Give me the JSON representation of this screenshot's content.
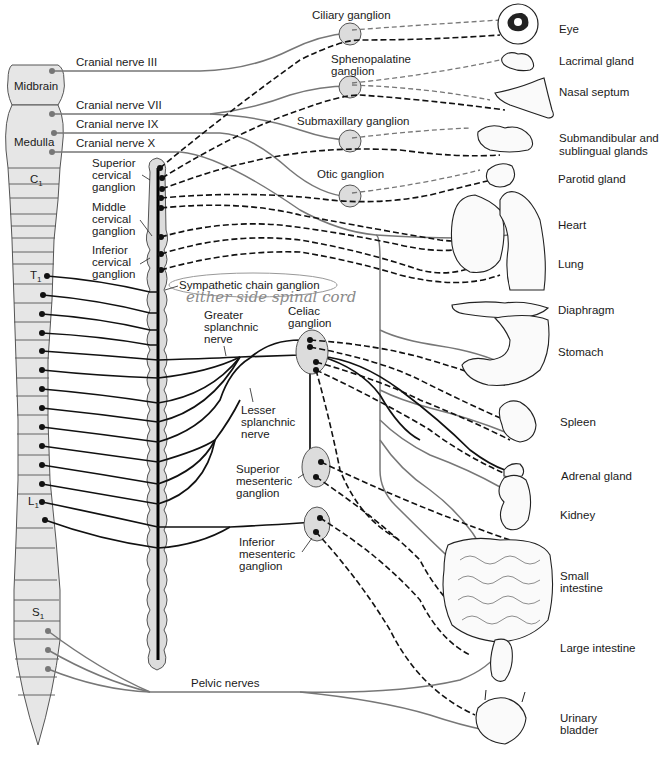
{
  "diagram": {
    "cns": {
      "regions": [
        {
          "id": "midbrain",
          "label": "Midbrain"
        },
        {
          "id": "medulla",
          "label": "Medulla"
        }
      ],
      "segment_labels": {
        "c1": "C",
        "c1_sub": "1",
        "t1": "T",
        "t1_sub": "1",
        "l1": "L",
        "l1_sub": "1",
        "s1": "S",
        "s1_sub": "1"
      }
    },
    "cranial_nerves": [
      {
        "label": "Cranial nerve III"
      },
      {
        "label": "Cranial nerve VII"
      },
      {
        "label": "Cranial nerve IX"
      },
      {
        "label": "Cranial nerve X"
      }
    ],
    "parasympathetic_ganglia": [
      {
        "label": "Ciliary ganglion"
      },
      {
        "label_line1": "Sphenopalatine",
        "label_line2": "ganglion"
      },
      {
        "label": "Submaxillary ganglion"
      },
      {
        "label": "Otic ganglion"
      }
    ],
    "cervical_ganglia": [
      {
        "line1": "Superior",
        "line2": "cervical",
        "line3": "ganglion"
      },
      {
        "line1": "Middle",
        "line2": "cervical",
        "line3": "ganglion"
      },
      {
        "line1": "Inferior",
        "line2": "cervical",
        "line3": "ganglion"
      }
    ],
    "sympathetic_chain": {
      "label": "Sympathetic chain ganglion",
      "handwritten_note": "either side spinal cord"
    },
    "splanchnic": {
      "greater": {
        "line1": "Greater",
        "line2": "splanchnic",
        "line3": "nerve"
      },
      "lesser": {
        "line1": "Lesser",
        "line2": "splanchnic",
        "line3": "nerve"
      }
    },
    "prevertebral_ganglia": [
      {
        "line1": "Celiac",
        "line2": "ganglion"
      },
      {
        "line1": "Superior",
        "line2": "mesenteric",
        "line3": "ganglion"
      },
      {
        "line1": "Inferior",
        "line2": "mesenteric",
        "line3": "ganglion"
      }
    ],
    "pelvic": {
      "label": "Pelvic nerves"
    },
    "organs": [
      {
        "id": "eye",
        "label": "Eye"
      },
      {
        "id": "lacrimal",
        "label": "Lacrimal gland"
      },
      {
        "id": "nasal",
        "label": "Nasal septum"
      },
      {
        "id": "submandibular",
        "line1": "Submandibular and",
        "line2": "sublingual glands"
      },
      {
        "id": "parotid",
        "label": "Parotid gland"
      },
      {
        "id": "heart",
        "label": "Heart"
      },
      {
        "id": "lung",
        "label": "Lung"
      },
      {
        "id": "diaphragm",
        "label": "Diaphragm"
      },
      {
        "id": "stomach",
        "label": "Stomach"
      },
      {
        "id": "spleen",
        "label": "Spleen"
      },
      {
        "id": "adrenal",
        "label": "Adrenal gland"
      },
      {
        "id": "kidney",
        "label": "Kidney"
      },
      {
        "id": "small-intestine",
        "line1": "Small",
        "line2": "intestine"
      },
      {
        "id": "large-intestine",
        "label": "Large intestine"
      },
      {
        "id": "bladder",
        "line1": "Urinary",
        "line2": "bladder"
      }
    ],
    "colors": {
      "parasympathetic": "#777777",
      "sympathetic": "#111111",
      "ganglion_fill": "#dcdcdc",
      "cord_fill": "#e6e6e6",
      "handwriting": "#8a8a8a"
    }
  }
}
